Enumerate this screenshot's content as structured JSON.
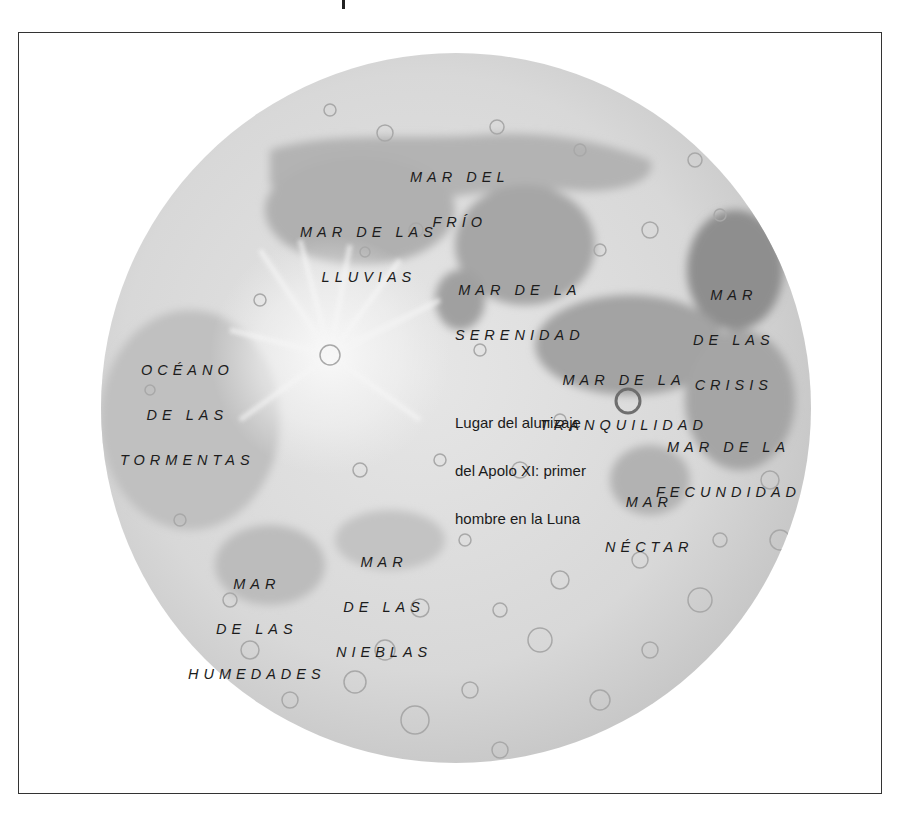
{
  "figure": {
    "title": "",
    "colors": {
      "frame": "#333333",
      "moon_base": "#d6d6d6",
      "maria": "#a9a9a9",
      "maria_dark": "#8f8f8f",
      "highlands": "#e4e4e4",
      "label_text": "#1c1c1c",
      "landing_marker": "#707070"
    }
  },
  "labels": {
    "mar_frio": {
      "line1": "MAR DEL",
      "line2": "FRÍO"
    },
    "mar_lluvias": {
      "line1": "MAR DE LAS",
      "line2": "LLUVIAS"
    },
    "mar_serenidad": {
      "line1": "MAR DE LA",
      "line2": "SERENIDAD"
    },
    "mar_crisis": {
      "line1": "MAR",
      "line2": "DE LAS",
      "line3": "CRISIS"
    },
    "oceano_tormentas": {
      "line1": "OCÉANO",
      "line2": "DE LAS",
      "line3": "TORMENTAS"
    },
    "mar_tranquilidad": {
      "line1": "MAR DE LA",
      "line2": "TRANQUILIDAD"
    },
    "mar_fecundidad": {
      "line1": "MAR DE LA",
      "line2": "FECUNDIDAD"
    },
    "mar_nectar": {
      "line1": "MAR",
      "line2": "NÉCTAR"
    },
    "mar_nieblas": {
      "line1": "MAR",
      "line2": "DE LAS",
      "line3": "NIEBLAS"
    },
    "mar_humedades": {
      "line1": "MAR",
      "line2": "DE LAS",
      "line3": "HUMEDADES"
    }
  },
  "annotation": {
    "landing_site": {
      "line1": "Lugar del alunizaje",
      "line2": "del Apolo XI: primer",
      "line3": "hombre en la Luna",
      "marker": "circle"
    }
  }
}
